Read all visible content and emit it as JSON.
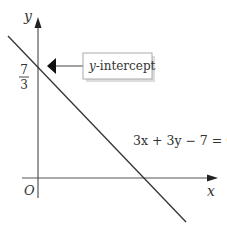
{
  "diagram": {
    "axes": {
      "x_label": "x",
      "y_label": "y",
      "origin_label": "O"
    },
    "intercept": {
      "numerator": "7",
      "denominator": "3"
    },
    "callout": {
      "text_italic": "y",
      "text_rest": "-intercept"
    },
    "equation": "3x + 3y − 7 = 0",
    "colors": {
      "line": "#333333",
      "axis": "#555555",
      "callout_border": "#aaaaaa",
      "callout_shadow": "#dddddd"
    }
  }
}
